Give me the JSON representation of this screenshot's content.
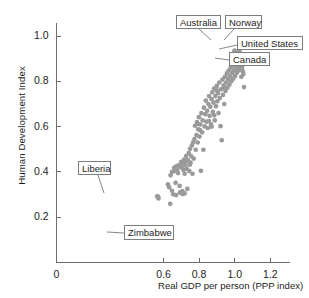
{
  "chart_data": {
    "type": "scatter",
    "title": "",
    "xlabel": "Real GDP per person (PPP index)",
    "ylabel": "Human Development Index",
    "xlim": [
      0,
      1.31
    ],
    "ylim": [
      0,
      1.06
    ],
    "grid": false,
    "legend": "none",
    "xticks": [
      {
        "value": 0,
        "label": "0"
      },
      {
        "value": 0.6,
        "label": "0.6"
      },
      {
        "value": 0.8,
        "label": "0.8"
      },
      {
        "value": 1.0,
        "label": "1.0"
      },
      {
        "value": 1.2,
        "label": "1.2"
      }
    ],
    "yticks": [
      {
        "value": 0.2,
        "label": "0.2"
      },
      {
        "value": 0.4,
        "label": "0.4"
      },
      {
        "value": 0.6,
        "label": "0.6"
      },
      {
        "value": 0.8,
        "label": "0.8"
      },
      {
        "value": 1.0,
        "label": "1.0"
      }
    ],
    "point_color": "#9a9a9a",
    "axis_color": "#6d6d6d",
    "points": [
      [
        0.572,
        0.148
      ],
      [
        0.565,
        0.292
      ],
      [
        0.572,
        0.283
      ],
      [
        0.625,
        0.345
      ],
      [
        0.632,
        0.332
      ],
      [
        0.638,
        0.259
      ],
      [
        0.648,
        0.317
      ],
      [
        0.655,
        0.301
      ],
      [
        0.662,
        0.404
      ],
      [
        0.668,
        0.352
      ],
      [
        0.671,
        0.298
      ],
      [
        0.678,
        0.412
      ],
      [
        0.682,
        0.395
      ],
      [
        0.688,
        0.427
      ],
      [
        0.691,
        0.338
      ],
      [
        0.695,
        0.308
      ],
      [
        0.7,
        0.444
      ],
      [
        0.704,
        0.419
      ],
      [
        0.708,
        0.302
      ],
      [
        0.712,
        0.409
      ],
      [
        0.716,
        0.455
      ],
      [
        0.719,
        0.392
      ],
      [
        0.723,
        0.43
      ],
      [
        0.727,
        0.47
      ],
      [
        0.731,
        0.414
      ],
      [
        0.734,
        0.325
      ],
      [
        0.738,
        0.449
      ],
      [
        0.742,
        0.483
      ],
      [
        0.745,
        0.404
      ],
      [
        0.749,
        0.502
      ],
      [
        0.752,
        0.441
      ],
      [
        0.756,
        0.469
      ],
      [
        0.76,
        0.517
      ],
      [
        0.763,
        0.392
      ],
      [
        0.767,
        0.531
      ],
      [
        0.77,
        0.459
      ],
      [
        0.774,
        0.545
      ],
      [
        0.777,
        0.604
      ],
      [
        0.781,
        0.498
      ],
      [
        0.785,
        0.563
      ],
      [
        0.788,
        0.62
      ],
      [
        0.792,
        0.53
      ],
      [
        0.795,
        0.588
      ],
      [
        0.799,
        0.642
      ],
      [
        0.802,
        0.556
      ],
      [
        0.806,
        0.61
      ],
      [
        0.81,
        0.405
      ],
      [
        0.813,
        0.66
      ],
      [
        0.817,
        0.575
      ],
      [
        0.82,
        0.628
      ],
      [
        0.824,
        0.498
      ],
      [
        0.827,
        0.684
      ],
      [
        0.831,
        0.601
      ],
      [
        0.835,
        0.655
      ],
      [
        0.838,
        0.715
      ],
      [
        0.842,
        0.622
      ],
      [
        0.845,
        0.67
      ],
      [
        0.849,
        0.594
      ],
      [
        0.852,
        0.7
      ],
      [
        0.856,
        0.735
      ],
      [
        0.859,
        0.648
      ],
      [
        0.863,
        0.688
      ],
      [
        0.867,
        0.61
      ],
      [
        0.87,
        0.722
      ],
      [
        0.874,
        0.752
      ],
      [
        0.877,
        0.665
      ],
      [
        0.881,
        0.706
      ],
      [
        0.884,
        0.768
      ],
      [
        0.888,
        0.628
      ],
      [
        0.891,
        0.735
      ],
      [
        0.895,
        0.69
      ],
      [
        0.899,
        0.78
      ],
      [
        0.902,
        0.712
      ],
      [
        0.906,
        0.748
      ],
      [
        0.909,
        0.66
      ],
      [
        0.913,
        0.795
      ],
      [
        0.916,
        0.726
      ],
      [
        0.92,
        0.602
      ],
      [
        0.923,
        0.765
      ],
      [
        0.927,
        0.54
      ],
      [
        0.931,
        0.808
      ],
      [
        0.934,
        0.74
      ],
      [
        0.938,
        0.782
      ],
      [
        0.941,
        0.7
      ],
      [
        0.945,
        0.82
      ],
      [
        0.948,
        0.758
      ],
      [
        0.952,
        0.795
      ],
      [
        0.956,
        0.835
      ],
      [
        0.959,
        0.772
      ],
      [
        0.963,
        0.81
      ],
      [
        0.966,
        0.848
      ],
      [
        0.97,
        0.786
      ],
      [
        0.973,
        0.822
      ],
      [
        0.977,
        0.86
      ],
      [
        0.98,
        0.8
      ],
      [
        0.984,
        0.836
      ],
      [
        0.988,
        0.868
      ],
      [
        0.991,
        0.812
      ],
      [
        0.995,
        0.848
      ],
      [
        0.998,
        0.876
      ],
      [
        1.002,
        0.824
      ],
      [
        1.005,
        0.856
      ],
      [
        1.009,
        0.884
      ],
      [
        1.012,
        0.838
      ],
      [
        1.016,
        0.866
      ],
      [
        1.02,
        0.89
      ],
      [
        1.023,
        0.848
      ],
      [
        1.027,
        0.872
      ],
      [
        1.03,
        0.858
      ],
      [
        1.034,
        0.88
      ],
      [
        1.037,
        0.82
      ],
      [
        1.041,
        0.862
      ],
      [
        1.045,
        0.845
      ],
      [
        1.048,
        0.832
      ],
      [
        1.052,
        0.775
      ],
      [
        0.94,
        0.77
      ],
      [
        0.9,
        0.76
      ],
      [
        0.885,
        0.65
      ],
      [
        0.87,
        0.6
      ],
      [
        0.855,
        0.625
      ],
      [
        0.805,
        0.585
      ],
      [
        0.79,
        0.612
      ],
      [
        0.748,
        0.432
      ],
      [
        0.735,
        0.452
      ],
      [
        0.722,
        0.445
      ],
      [
        0.709,
        0.44
      ],
      [
        0.697,
        0.435
      ],
      [
        0.684,
        0.429
      ],
      [
        0.672,
        0.425
      ],
      [
        0.66,
        0.418
      ],
      [
        0.648,
        0.4
      ],
      [
        0.64,
        0.385
      ],
      [
        0.693,
        0.31
      ],
      [
        0.706,
        0.315
      ],
      [
        0.719,
        0.305
      ]
    ],
    "annotations": [
      {
        "name": "Australia",
        "point": [
          0.999,
          0.935
        ],
        "box": {
          "left": 176,
          "top": 15,
          "width": 45,
          "height": 14
        },
        "leader_from": [
          199,
          29
        ],
        "leader_to": [
          211,
          40
        ]
      },
      {
        "name": "Norway",
        "point": [
          1.026,
          0.932
        ],
        "box": {
          "left": 225,
          "top": 15,
          "width": 37,
          "height": 14
        },
        "leader_from": [
          234,
          29
        ],
        "leader_to": [
          224,
          40
        ]
      },
      {
        "name": "United States",
        "point": [
          1.036,
          0.893
        ],
        "box": {
          "left": 237,
          "top": 36,
          "width": 66,
          "height": 14
        },
        "leader_from": [
          237,
          45
        ],
        "leader_to": [
          219,
          49
        ]
      },
      {
        "name": "Canada",
        "point": [
          1.028,
          0.863
        ],
        "box": {
          "left": 229,
          "top": 52,
          "width": 41,
          "height": 14
        },
        "leader_from": [
          229,
          60
        ],
        "leader_to": [
          215,
          58
        ]
      },
      {
        "name": "Liberia",
        "point": [
          0.569,
          0.29
        ],
        "box": {
          "left": 78,
          "top": 161,
          "width": 33,
          "height": 14
        },
        "leader_from": [
          98,
          175
        ],
        "leader_to": [
          104,
          193
        ]
      },
      {
        "name": "Zimbabwe",
        "point": [
          0.572,
          0.148
        ],
        "box": {
          "left": 124,
          "top": 225,
          "width": 50,
          "height": 15
        },
        "leader_from": [
          124,
          233
        ],
        "leader_to": [
          107,
          232
        ]
      }
    ]
  }
}
